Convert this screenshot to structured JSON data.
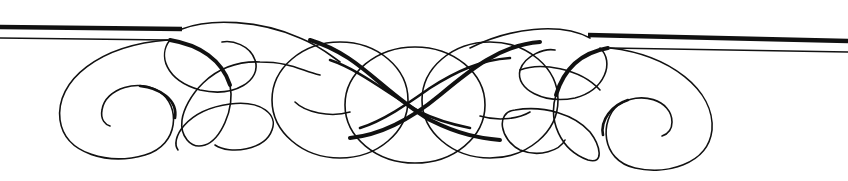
{
  "ornament": {
    "type": "calligraphic-flourish-divider",
    "ink_color": "#111111",
    "background_color": "#ffffff",
    "symmetric": true
  }
}
